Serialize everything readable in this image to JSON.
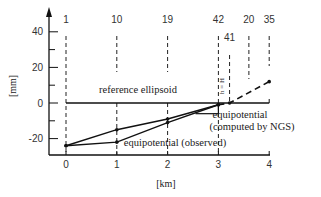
{
  "chart_data": {
    "type": "line",
    "title": "",
    "xlabel": "[km]",
    "ylabel": "[mm]",
    "xlim": [
      0,
      4
    ],
    "ylim": [
      -30,
      50
    ],
    "x_ticks": [
      "0",
      "1",
      "2",
      "3",
      "4"
    ],
    "y_ticks": [
      "40",
      "20",
      "0",
      "-20"
    ],
    "grid": false,
    "benchmarks": [
      {
        "label": "1",
        "x": 0.0
      },
      {
        "label": "10",
        "x": 1.0
      },
      {
        "label": "19",
        "x": 2.0
      },
      {
        "label": "42",
        "x": 3.0
      },
      {
        "label": "41",
        "x": 3.22
      },
      {
        "label": "20",
        "x": 3.6
      },
      {
        "label": "35",
        "x": 4.0
      }
    ],
    "series": [
      {
        "name": "reference ellipsoid",
        "style": "solid",
        "x": [
          0,
          4
        ],
        "values": [
          0,
          0
        ]
      },
      {
        "name": "equipotential (computed by NGS)",
        "style": "solid",
        "x": [
          0,
          1,
          2,
          3
        ],
        "values": [
          -24,
          -15,
          -9,
          -1
        ]
      },
      {
        "name": "equipotential (observed)",
        "style": "solid",
        "x": [
          0,
          1,
          2,
          3
        ],
        "values": [
          -24,
          -22,
          -11,
          -1
        ]
      },
      {
        "name": "extrapolation",
        "style": "dashed",
        "x": [
          3,
          3.22,
          4
        ],
        "values": [
          -1,
          0,
          12
        ]
      }
    ],
    "annotations": [
      {
        "text": "reference ellipsoid",
        "x": 1.3,
        "y": 5
      },
      {
        "text": "h = H",
        "x": 3.12,
        "y": 12,
        "rotation": -90
      },
      {
        "text": "equipotential",
        "x": 3.1,
        "y": -7
      },
      {
        "text": "(computed by NGS)",
        "x": 3.1,
        "y": -13
      },
      {
        "text": "equipotential (observed)",
        "x": 2.1,
        "y": -20
      }
    ],
    "legend": null
  }
}
